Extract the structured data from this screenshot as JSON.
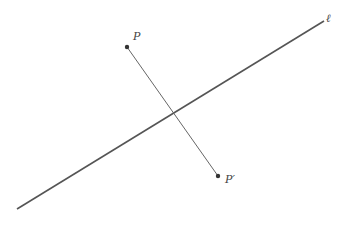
{
  "diagram": {
    "line": {
      "label": "ℓ",
      "x1": 17,
      "y1": 209,
      "x2": 324,
      "y2": 21,
      "color": "#555555"
    },
    "segment": {
      "x1": 127,
      "y1": 47,
      "x2": 218,
      "y2": 176,
      "color": "#555555"
    },
    "points": [
      {
        "id": "P",
        "label": "P",
        "x": 127,
        "y": 47,
        "label_x": 133,
        "label_y": 40
      },
      {
        "id": "P-prime",
        "label": "P′",
        "x": 218,
        "y": 176,
        "label_x": 225,
        "label_y": 183
      }
    ],
    "line_label_pos": {
      "x": 326,
      "y": 22
    }
  }
}
